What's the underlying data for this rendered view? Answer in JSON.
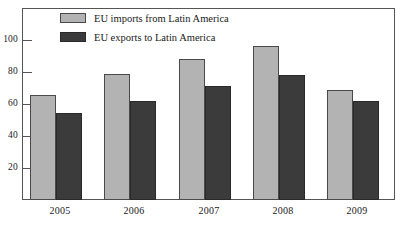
{
  "chart_data": {
    "type": "bar",
    "title": "",
    "subtitle": "",
    "xlabel": "",
    "ylabel": "",
    "categories": [
      "2005",
      "2006",
      "2007",
      "2008",
      "2009"
    ],
    "series": [
      {
        "name": "EU imports from Latin America",
        "color": "#b3b3b3",
        "values": [
          65.5,
          79,
          88,
          96,
          69
        ]
      },
      {
        "name": "EU exports to Latin America",
        "color": "#3b3b3b",
        "values": [
          54.5,
          62,
          71,
          78,
          62
        ]
      }
    ],
    "ylim": [
      0,
      110
    ],
    "yticks": [
      20,
      40,
      60,
      80,
      100
    ],
    "ytick_labels": [
      "20",
      "40",
      "60",
      "80",
      "100"
    ],
    "grid": false,
    "legend_position": "top-left",
    "axis_color": "#555555",
    "background": "#ffffff"
  },
  "legend": {
    "items": [
      {
        "label": "EU imports from Latin America",
        "swatch": "light"
      },
      {
        "label": "EU exports to Latin America",
        "swatch": "dark"
      }
    ]
  }
}
